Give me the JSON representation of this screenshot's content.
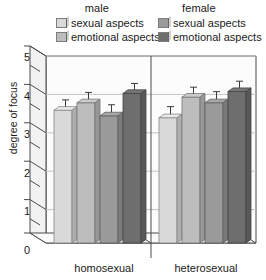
{
  "chart_data": {
    "type": "bar",
    "title": "",
    "xlabel": "",
    "ylabel": "degree of focus",
    "ylim": [
      0,
      5
    ],
    "yticks": [
      5,
      4,
      3,
      2,
      1,
      0
    ],
    "grid": true,
    "legend_position": "top",
    "legend_groups": [
      {
        "group": "male",
        "entries": [
          "sexual aspects",
          "emotional aspects"
        ]
      },
      {
        "group": "female",
        "entries": [
          "sexual aspects",
          "emotional aspects"
        ]
      }
    ],
    "categories": [
      "homosexual",
      "heterosexual"
    ],
    "series": [
      {
        "name": "male sexual aspects",
        "color": "#d9d9d9",
        "values": [
          3.55,
          3.35
        ],
        "errors": [
          0.18,
          0.2
        ]
      },
      {
        "name": "male emotional aspects",
        "color": "#bdbdbd",
        "values": [
          3.75,
          3.9
        ],
        "errors": [
          0.18,
          0.17
        ]
      },
      {
        "name": "female sexual aspects",
        "color": "#9a9a9a",
        "values": [
          3.4,
          3.75
        ],
        "errors": [
          0.2,
          0.2
        ]
      },
      {
        "name": "female emotional aspects",
        "color": "#6e6e6e",
        "values": [
          4.0,
          4.05
        ],
        "errors": [
          0.17,
          0.18
        ]
      }
    ]
  },
  "legend": {
    "male_header": "male",
    "female_header": "female",
    "male_sexual": "sexual aspects",
    "male_emotional": "emotional aspects",
    "female_sexual": "sexual aspects",
    "female_emotional": "emotional aspects"
  },
  "axis": {
    "y_title": "degree of focus",
    "y_5": "5",
    "y_4": "4",
    "y_3": "3",
    "y_2": "2",
    "y_1": "1",
    "y_0": "0",
    "x_cat_1": "homosexual",
    "x_cat_2": "heterosexual"
  },
  "colors": {
    "male_sexual": "#d9d9d9",
    "male_emotional": "#bdbdbd",
    "female_sexual": "#9a9a9a",
    "female_emotional": "#6e6e6e",
    "axis": "#333333",
    "grid": "#c8c8c8",
    "wall": "#fcfcfc"
  }
}
